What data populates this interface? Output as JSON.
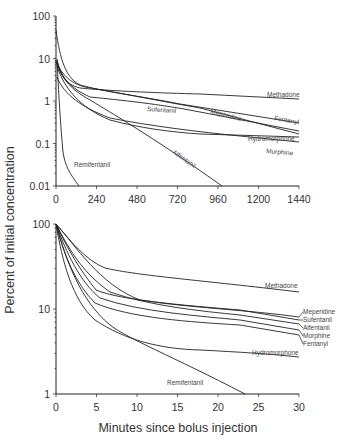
{
  "chart_data": [
    {
      "type": "line",
      "panel": "top",
      "title": "",
      "xlabel": "",
      "ylabel": "Percent of initial concentration",
      "yscale": "log",
      "xlim": [
        0,
        1440
      ],
      "ylim": [
        0.01,
        100
      ],
      "x_ticks": [
        "0",
        "240",
        "480",
        "720",
        "960",
        "1200",
        "1440"
      ],
      "y_ticks": [
        "100",
        "10",
        "1",
        "0.1",
        "0.01"
      ],
      "grid": false,
      "series": [
        {
          "name": "Methadone",
          "x": [
            0,
            60,
            240,
            720,
            1440
          ],
          "values": [
            10,
            3.2,
            1.9,
            1.5,
            1.05
          ]
        },
        {
          "name": "Fentanyl",
          "x": [
            0,
            60,
            240,
            720,
            1440
          ],
          "values": [
            30,
            3.5,
            1.9,
            0.85,
            0.3
          ]
        },
        {
          "name": "Meperidine",
          "x": [
            0,
            60,
            240,
            720,
            1440
          ],
          "values": [
            9,
            2.6,
            1.6,
            0.75,
            0.17
          ]
        },
        {
          "name": "Sufentanil",
          "x": [
            0,
            60,
            240,
            720,
            1440
          ],
          "values": [
            8,
            2.0,
            0.95,
            0.6,
            0.2
          ]
        },
        {
          "name": "Hydromorphone",
          "x": [
            0,
            60,
            240,
            720,
            1440
          ],
          "values": [
            6,
            1.2,
            0.4,
            0.14,
            0.09
          ]
        },
        {
          "name": "Morphine",
          "x": [
            0,
            60,
            240,
            720,
            1440
          ],
          "values": [
            3.5,
            1.4,
            0.5,
            0.14,
            0.065
          ]
        },
        {
          "name": "Alfentanil",
          "x": [
            0,
            60,
            240,
            720,
            980
          ],
          "values": [
            9,
            2.5,
            0.45,
            0.05,
            0.01
          ]
        },
        {
          "name": "Remifentanil",
          "x": [
            0,
            15,
            45,
            90,
            170
          ],
          "values": [
            9,
            0.6,
            0.05,
            0.025,
            0.01
          ]
        }
      ],
      "legend": "inline labels at line ends"
    },
    {
      "type": "line",
      "panel": "bottom",
      "title": "",
      "xlabel": "Minutes since bolus injection",
      "ylabel": "Percent of initial concentration",
      "yscale": "log",
      "xlim": [
        0,
        30
      ],
      "ylim": [
        1,
        100
      ],
      "x_ticks": [
        "0",
        "5",
        "10",
        "15",
        "20",
        "25",
        "30"
      ],
      "y_ticks": [
        "100",
        "10",
        "1"
      ],
      "grid": false,
      "series": [
        {
          "name": "Methadone",
          "x": [
            0,
            2,
            5,
            10,
            20,
            30
          ],
          "values": [
            100,
            55,
            33,
            27,
            24,
            21
          ]
        },
        {
          "name": "Meperidine",
          "x": [
            0,
            2,
            5,
            10,
            20,
            30
          ],
          "values": [
            100,
            62,
            30,
            15,
            10,
            8.0
          ]
        },
        {
          "name": "Sufentanil",
          "x": [
            0,
            2,
            5,
            10,
            20,
            30
          ],
          "values": [
            100,
            45,
            18,
            12,
            9.5,
            7.5
          ]
        },
        {
          "name": "Alfentanil",
          "x": [
            0,
            2,
            5,
            10,
            20,
            30
          ],
          "values": [
            100,
            48,
            22,
            13,
            9,
            6.8
          ]
        },
        {
          "name": "Morphine",
          "x": [
            0,
            2,
            5,
            10,
            20,
            30
          ],
          "values": [
            100,
            40,
            15,
            11,
            7.5,
            5.5
          ]
        },
        {
          "name": "Fentanyl",
          "x": [
            0,
            2,
            5,
            10,
            20,
            30
          ],
          "values": [
            100,
            35,
            12,
            8,
            6,
            4.8
          ]
        },
        {
          "name": "Hydromorphone",
          "x": [
            0,
            2,
            5,
            10,
            20,
            30
          ],
          "values": [
            100,
            25,
            7,
            4,
            3.2,
            2.8
          ]
        },
        {
          "name": "Remifentanil",
          "x": [
            0,
            2,
            5,
            10,
            15,
            23
          ],
          "values": [
            100,
            30,
            9,
            4,
            2.2,
            1.0
          ]
        }
      ],
      "legend": "inline labels at right edge"
    }
  ],
  "labels": {
    "y_axis_title": "Percent of initial concentration",
    "x_axis_title": "Minutes since bolus injection",
    "top": {
      "methadone": "Methadone",
      "fentanyl": "Fentanyl",
      "meperidine": "Meperidine",
      "sufentanil": "Sufentanil",
      "hydromorphone": "Hydromorphone",
      "morphine": "Morphine",
      "alfentanil": "Alfentanil",
      "remifentanil": "Remifentanil"
    },
    "bottom": {
      "methadone": "Methadone",
      "meperidine": "Meperidine",
      "sufentanil": "Sufentanil",
      "alfentanil": "Alfentanil",
      "morphine": "Morphine",
      "fentanyl": "Fentanyl",
      "hydromorphone": "Hydromorphone",
      "remifentanil": "Remifentanil"
    },
    "top_xticks": [
      "0",
      "240",
      "480",
      "720",
      "960",
      "1200",
      "1440"
    ],
    "top_yticks": [
      "100",
      "10",
      "1",
      "0.1",
      "0.01"
    ],
    "bottom_xticks": [
      "0",
      "5",
      "10",
      "15",
      "20",
      "25",
      "30"
    ],
    "bottom_yticks": [
      "100",
      "10",
      "1"
    ]
  }
}
